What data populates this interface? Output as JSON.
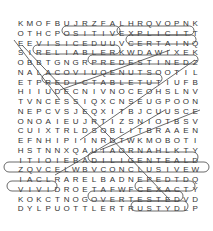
{
  "puzzle": {
    "type": "word-search",
    "rows": [
      "KMOFBUJRZFALHRQVOPNK",
      "OTHCPOSITIVEXPLICITT",
      "EEVISICEDUUVCERTAINQ",
      "SIRELIABLERKWDAWIXEK",
      "OBBTGNGRPREDESTINEDZ",
      "NALACOVIUQENUTSOOTIL",
      "ETPREDICTABLETUTIUFB",
      "HIIUDECNIVNOCEOHSLNV",
      "TVNCESSIQXCNSEUGPOON",
      "NEPCVSJEQXITBJCUUSCE",
      "ONOAIEUJRTIZSNIOTBSV",
      "CUIXTRLDSOBLITBRAAEN",
      "EFNHIPIINRDTWKMOBOTI",
      "HSTNNXQAUIAORNAHLKTY",
      "ITIOIEBADILIGENTEALD",
      "ZQVCELWBVCONCLUSIVEW",
      "IACLRARELBADNEPEDTDQ",
      "VIVIDROETAFWFCEXACTY",
      "KOKCTNOGOVERTESTEDVD",
      "DYLPUOTTLERTRUSTYDLP"
    ],
    "found_words": [
      "POSITIVE",
      "EXPLICIT",
      "CERTAIN",
      "RELIABLE",
      "PREDESTINED",
      "PREDICTABLE",
      "CONVINCED",
      "DILIGENT",
      "CONCLUSIVE",
      "DEPENDABLE",
      "VIVID",
      "EXACT",
      "OVERTESTED",
      "TRUSTY"
    ],
    "line_color": "#333333"
  }
}
